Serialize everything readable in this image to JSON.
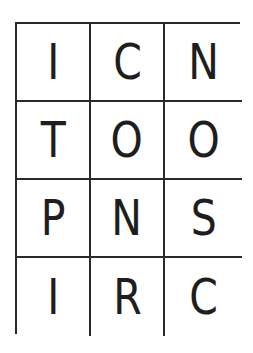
{
  "puzzle": {
    "rows": 4,
    "cols": 3,
    "cells": [
      [
        "I",
        "C",
        "N"
      ],
      [
        "T",
        "O",
        "O"
      ],
      [
        "P",
        "N",
        "S"
      ],
      [
        "I",
        "R",
        "C"
      ]
    ]
  },
  "colors": {
    "border": "#2a2a2a",
    "text": "#1e1e1e",
    "background": "#ffffff"
  }
}
